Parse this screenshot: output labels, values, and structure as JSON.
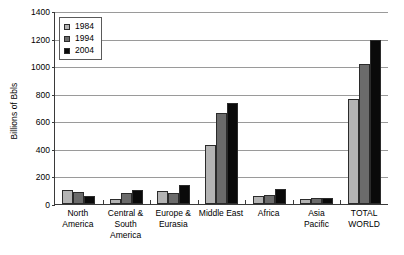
{
  "chart_data": {
    "type": "bar",
    "title": "",
    "xlabel": "",
    "ylabel": "Billions of Bbls",
    "ylim": [
      0,
      1400
    ],
    "ytick_step": 200,
    "yticks": [
      0,
      200,
      400,
      600,
      800,
      1000,
      1200,
      1400
    ],
    "grid": true,
    "legend_position": "top-left",
    "categories": [
      "North America",
      "Central & South America",
      "Europe & Eurasia",
      "Middle East",
      "Africa",
      "Asia Pacific",
      "TOTAL WORLD"
    ],
    "category_lines": [
      [
        "North",
        "America"
      ],
      [
        "Central &",
        "South",
        "America"
      ],
      [
        "Europe &",
        "Eurasia"
      ],
      [
        "Middle East"
      ],
      [
        "Africa"
      ],
      [
        "Asia",
        "Pacific"
      ],
      [
        "TOTAL",
        "WORLD"
      ]
    ],
    "series": [
      {
        "name": "1984",
        "color": "#b4b4b4",
        "values": [
          100,
          36,
          98,
          430,
          57,
          39,
          762
        ]
      },
      {
        "name": "1994",
        "color": "#6b6b6b",
        "values": [
          88,
          79,
          80,
          657,
          65,
          41,
          1017
        ]
      },
      {
        "name": "2004",
        "color": "#0a0a0a",
        "values": [
          61,
          101,
          139,
          733,
          112,
          41,
          1189
        ]
      }
    ]
  },
  "legend": {
    "items": [
      {
        "label": "1984",
        "color": "#b4b4b4"
      },
      {
        "label": "1994",
        "color": "#6b6b6b"
      },
      {
        "label": "2004",
        "color": "#0a0a0a"
      }
    ]
  }
}
